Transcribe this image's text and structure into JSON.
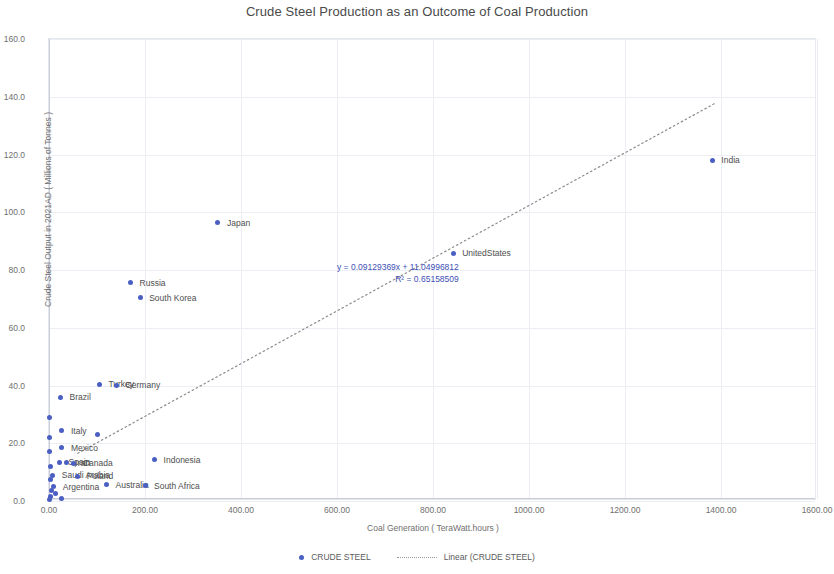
{
  "chart_data": {
    "type": "scatter",
    "title": "Crude Steel Production as an Outcome of Coal Production",
    "xlabel": "Coal Generation ( TeraWatt.hours )",
    "ylabel": "Crude Steel Output in 2021AD ( Millions of Tonnes )",
    "xlim": [
      0,
      1600
    ],
    "ylim": [
      0,
      160
    ],
    "xticks": [
      "0.00",
      "200.00",
      "400.00",
      "600.00",
      "800.00",
      "1000.00",
      "1200.00",
      "1400.00",
      "1600.00"
    ],
    "xtick_values": [
      0,
      200,
      400,
      600,
      800,
      1000,
      1200,
      1400,
      1600
    ],
    "yticks": [
      "0.0",
      "20.0",
      "40.0",
      "60.0",
      "80.0",
      "100.0",
      "120.0",
      "140.0",
      "160.0"
    ],
    "ytick_values": [
      0,
      20,
      40,
      60,
      80,
      100,
      120,
      140,
      160
    ],
    "grid": true,
    "legend_position": "bottom",
    "series_name": "CRUDE STEEL",
    "marker_color": "#4a5fc1",
    "trendline": {
      "label": "Linear (CRUDE STEEL)",
      "equation": "y = 0.09129369x + 11.04996812",
      "r2": "R² = 0.65158509",
      "slope": 0.09129369,
      "intercept": 11.04996812,
      "x_start": 60,
      "x_end": 1390,
      "style": "dotted",
      "color": "#8a8a8a"
    },
    "points": [
      {
        "label": "India",
        "x": 1382,
        "y": 118.0,
        "label_dx": 9,
        "label_dy": 0
      },
      {
        "label": "Japan",
        "x": 352,
        "y": 96.3,
        "label_dx": 9,
        "label_dy": 0
      },
      {
        "label": "UnitedStates",
        "x": 842,
        "y": 85.8,
        "label_dx": 9,
        "label_dy": 0
      },
      {
        "label": "Russia",
        "x": 170,
        "y": 75.6,
        "label_dx": 9,
        "label_dy": 0
      },
      {
        "label": "South Korea",
        "x": 190,
        "y": 70.4,
        "label_dx": 9,
        "label_dy": 0
      },
      {
        "label": "Turkey",
        "x": 105,
        "y": 40.4,
        "label_dx": 9,
        "label_dy": 0
      },
      {
        "label": "Germany",
        "x": 140,
        "y": 40.1,
        "label_dx": 9,
        "label_dy": 0
      },
      {
        "label": "Brazil",
        "x": 24,
        "y": 36.0,
        "label_dx": 9,
        "label_dy": 0
      },
      {
        "label": "",
        "x": 2,
        "y": 29.0,
        "label_dx": 0,
        "label_dy": 0
      },
      {
        "label": "Italy",
        "x": 27,
        "y": 24.4,
        "label_dx": 9,
        "label_dy": 0
      },
      {
        "label": "",
        "x": 100,
        "y": 23.0,
        "label_dx": 0,
        "label_dy": 0
      },
      {
        "label": "",
        "x": 2,
        "y": 22.0,
        "label_dx": 0,
        "label_dy": 0
      },
      {
        "label": "Mexico",
        "x": 27,
        "y": 18.5,
        "label_dx": 9,
        "label_dy": 0
      },
      {
        "label": "",
        "x": 2,
        "y": 17.0,
        "label_dx": 0,
        "label_dy": 0
      },
      {
        "label": "Indonesia",
        "x": 220,
        "y": 14.3,
        "label_dx": 9,
        "label_dy": 0
      },
      {
        "label": "Spain",
        "x": 22,
        "y": 13.5,
        "label_dx": 9,
        "label_dy": 0
      },
      {
        "label": "Iran",
        "x": 36,
        "y": 13.2,
        "label_dx": 9,
        "label_dy": 0
      },
      {
        "label": "Canada",
        "x": 52,
        "y": 13.0,
        "label_dx": 9,
        "label_dy": 0
      },
      {
        "label": "",
        "x": 4,
        "y": 12.0,
        "label_dx": 0,
        "label_dy": 0
      },
      {
        "label": "Saudi Arabia",
        "x": 8,
        "y": 9.0,
        "label_dx": 9,
        "label_dy": 0
      },
      {
        "label": "Poland",
        "x": 60,
        "y": 8.5,
        "label_dx": 9,
        "label_dy": 0
      },
      {
        "label": "",
        "x": 4,
        "y": 7.5,
        "label_dx": 0,
        "label_dy": 0
      },
      {
        "label": "Argentina",
        "x": 10,
        "y": 5.0,
        "label_dx": 9,
        "label_dy": 0
      },
      {
        "label": "Australia",
        "x": 120,
        "y": 5.6,
        "label_dx": 9,
        "label_dy": 0
      },
      {
        "label": "South Africa",
        "x": 200,
        "y": 5.2,
        "label_dx": 9,
        "label_dy": 0
      },
      {
        "label": "",
        "x": 6,
        "y": 3.5,
        "label_dx": 0,
        "label_dy": 0
      },
      {
        "label": "",
        "x": 14,
        "y": 2.5,
        "label_dx": 0,
        "label_dy": 0
      },
      {
        "label": "",
        "x": 4,
        "y": 1.5,
        "label_dx": 0,
        "label_dy": 0
      },
      {
        "label": "",
        "x": 26,
        "y": 1.0,
        "label_dx": 0,
        "label_dy": 0
      },
      {
        "label": "",
        "x": 2,
        "y": 0.6,
        "label_dx": 0,
        "label_dy": 0
      }
    ]
  },
  "annotation": {
    "x": 288,
    "y": 222
  },
  "legend": {
    "series_label": "CRUDE STEEL",
    "trend_label": "Linear (CRUDE STEEL)"
  }
}
